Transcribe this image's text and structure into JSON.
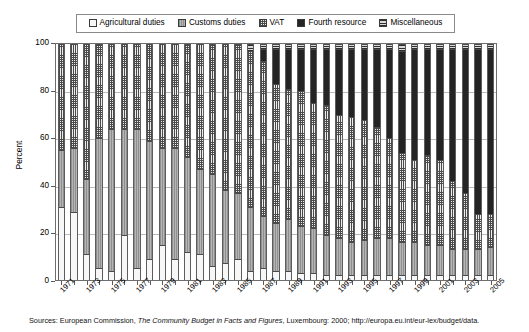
{
  "legend": {
    "position": "top",
    "entries": [
      {
        "label": "Agricultural duties",
        "key": "agricultural",
        "pattern": "light-dotted",
        "color": "#f7f7f7"
      },
      {
        "label": "Customs duties",
        "key": "customs",
        "pattern": "vertical-lines-gray",
        "color": "#a8a8a8"
      },
      {
        "label": "VAT",
        "key": "vat",
        "pattern": "grid-checkered",
        "color": "#ededed"
      },
      {
        "label": "Fourth resource",
        "key": "fourth",
        "pattern": "solid-black",
        "color": "#242424"
      },
      {
        "label": "Miscellaneous",
        "key": "misc",
        "pattern": "horizontal-lines",
        "color": "#d9d9d9"
      }
    ]
  },
  "axes": {
    "ylabel": "Percent",
    "yticks": [
      "0",
      "20",
      "40",
      "60",
      "80",
      "100"
    ],
    "ylim": [
      0,
      100
    ],
    "xlabels": [
      "1971",
      "1973",
      "1975",
      "1977",
      "1979",
      "1981",
      "1983",
      "1985",
      "1987",
      "1989",
      "1991",
      "1993",
      "1995",
      "1997",
      "1999",
      "2001",
      "2003",
      "2005"
    ],
    "grid": true
  },
  "source": {
    "prefix": "Sources: European Commission, ",
    "italic": "The Community Budget in Facts and Figures",
    "suffix": ", Luxembourg: 2000; http://europa.eu.int/eur-lex/budget/data."
  },
  "chart_data": {
    "type": "bar",
    "stacked": true,
    "normalized": true,
    "title": "",
    "xlabel": "",
    "ylabel": "Percent",
    "ylim": [
      0,
      100
    ],
    "grid": true,
    "legend_position": "top",
    "categories": [
      "1971",
      "1972",
      "1973",
      "1974",
      "1975",
      "1976",
      "1977",
      "1978",
      "1979",
      "1980",
      "1981",
      "1982",
      "1983",
      "1984",
      "1985",
      "1986",
      "1987",
      "1988",
      "1989",
      "1990",
      "1991",
      "1992",
      "1993",
      "1994",
      "1995",
      "1996",
      "1997",
      "1998",
      "1999",
      "2000",
      "2001",
      "2002",
      "2003",
      "2004",
      "2005"
    ],
    "series": [
      {
        "name": "Agricultural duties",
        "values": [
          31,
          29,
          11,
          5,
          4,
          19,
          5,
          9,
          15,
          9,
          12,
          11,
          6,
          7,
          9,
          4,
          5,
          4,
          4,
          3,
          3,
          2,
          2,
          2,
          2,
          2,
          2,
          2,
          2,
          2,
          2,
          2,
          2,
          2,
          2
        ]
      },
      {
        "name": "Customs duties",
        "values": [
          24,
          27,
          32,
          55,
          60,
          45,
          59,
          50,
          41,
          47,
          40,
          36,
          39,
          31,
          28,
          27,
          22,
          20,
          22,
          20,
          19,
          17,
          16,
          14,
          15,
          16,
          16,
          14,
          14,
          13,
          13,
          11,
          11,
          11,
          12
        ]
      },
      {
        "name": "VAT",
        "values": [
          45,
          44,
          57,
          40,
          36,
          36,
          36,
          41,
          44,
          44,
          48,
          53,
          55,
          62,
          63,
          66,
          66,
          59,
          55,
          57,
          53,
          55,
          52,
          53,
          51,
          47,
          42,
          38,
          35,
          38,
          36,
          29,
          24,
          15,
          14
        ]
      },
      {
        "name": "Fourth resource",
        "values": [
          0,
          0,
          0,
          0,
          0,
          0,
          0,
          0,
          0,
          0,
          0,
          0,
          0,
          0,
          0,
          0,
          5,
          15,
          17,
          18,
          23,
          24,
          28,
          29,
          30,
          33,
          38,
          43,
          47,
          45,
          47,
          56,
          61,
          70,
          70
        ]
      },
      {
        "name": "Miscellaneous",
        "values": [
          0,
          0,
          0,
          0,
          0,
          0,
          0,
          0,
          0,
          0,
          0,
          0,
          0,
          0,
          0,
          3,
          2,
          2,
          2,
          2,
          2,
          2,
          2,
          2,
          2,
          2,
          2,
          3,
          2,
          2,
          2,
          2,
          2,
          2,
          2
        ]
      }
    ]
  }
}
